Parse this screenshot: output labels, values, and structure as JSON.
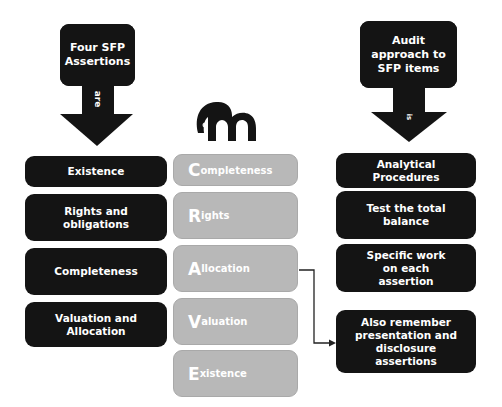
{
  "left_arrow": {
    "title": "Four SFP Assertions",
    "connector_label": "are"
  },
  "right_arrow": {
    "title": "Audit approach to SFP items",
    "connector_label": "is"
  },
  "logo": {
    "icon": "elephant-m-logo"
  },
  "left_boxes": [
    {
      "label": "Existence"
    },
    {
      "label": "Rights and obligations"
    },
    {
      "label": "Completeness"
    },
    {
      "label": "Valuation and Allocation"
    }
  ],
  "center_boxes": [
    {
      "initial": "C",
      "rest": "ompleteness"
    },
    {
      "initial": "R",
      "rest": "ights"
    },
    {
      "initial": "A",
      "rest": "llocation"
    },
    {
      "initial": "V",
      "rest": "aluation"
    },
    {
      "initial": "E",
      "rest": "xistence"
    }
  ],
  "right_boxes": [
    {
      "label": "Analytical Procedures"
    },
    {
      "label": "Test the total balance"
    },
    {
      "label": "Specific work on each assertion"
    },
    {
      "label": "Also remember presentation and disclosure assertions"
    }
  ],
  "colors": {
    "dark_box": "#141414",
    "grey_box": "#b8b8b8",
    "text_light": "#ffffff",
    "connector": "#222222"
  }
}
